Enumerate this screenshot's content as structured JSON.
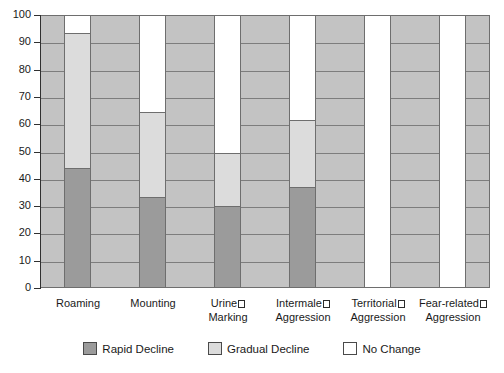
{
  "chart_data": {
    "type": "bar",
    "subtype": "stacked-100-percent",
    "title": "",
    "xlabel": "",
    "ylabel": "",
    "ylim": [
      0,
      100
    ],
    "ytick_step": 10,
    "yticks": [
      100,
      90,
      80,
      70,
      60,
      50,
      40,
      30,
      20,
      10,
      0
    ],
    "grid": true,
    "legend_position": "bottom",
    "categories": [
      "Roaming",
      "Mounting",
      "Urine Marking",
      "Intermale Aggression",
      "Territorial Aggression",
      "Fear-related Aggression"
    ],
    "category_lines": [
      [
        "Roaming",
        ""
      ],
      [
        "Mounting",
        ""
      ],
      [
        "Urine",
        "Marking"
      ],
      [
        "Intermale",
        "Aggression"
      ],
      [
        "Territorial",
        "Aggression"
      ],
      [
        "Fear-related",
        "Aggression"
      ]
    ],
    "series": [
      {
        "name": "Rapid Decline",
        "color": "#9b9b9b",
        "values": [
          44,
          33.5,
          30,
          37,
          0,
          0
        ]
      },
      {
        "name": "Gradual Decline",
        "color": "#dcdcdc",
        "values": [
          49.5,
          31,
          19.5,
          24.5,
          0,
          0
        ]
      },
      {
        "name": "No Change",
        "color": "#ffffff",
        "values": [
          6.5,
          35.5,
          50.5,
          38.5,
          100,
          100
        ]
      }
    ],
    "cumulative_tops": {
      "rapid_decline": [
        44,
        33.5,
        30,
        37,
        0,
        0
      ],
      "gradual_decline": [
        93.5,
        64.5,
        49.5,
        61.5,
        0,
        0
      ],
      "no_change": [
        100,
        100,
        100,
        100,
        100,
        100
      ]
    },
    "colors": {
      "plot_background": "#c3c3c3",
      "gridline": "#7d7d7d",
      "frame": "#6e6e6e",
      "axis": "#303030",
      "text": "#1a1a1a",
      "page_background": "#ffffff"
    }
  },
  "legend": {
    "items": [
      {
        "label": "Rapid Decline",
        "swatch": "rapid"
      },
      {
        "label": "Gradual Decline",
        "swatch": "gradual"
      },
      {
        "label": "No Change",
        "swatch": "none"
      }
    ]
  },
  "axis": {
    "y": {
      "labels": [
        "100",
        "90",
        "80",
        "70",
        "60",
        "50",
        "40",
        "30",
        "20",
        "10",
        "0"
      ]
    }
  }
}
